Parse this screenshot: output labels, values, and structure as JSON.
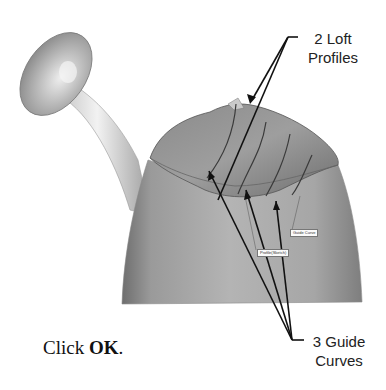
{
  "figure": {
    "callouts": {
      "loft_profiles": {
        "line1": "2 Loft",
        "line2": "Profiles"
      },
      "guide_curves": {
        "line1": "3 Guide",
        "line2": "Curves"
      }
    },
    "in_model_labels": {
      "guide_curve": "Guide Curve",
      "profile": "Profile(Sketch)"
    },
    "colors": {
      "surface": "#a8a8a8",
      "surface_dark": "#7d7d7d",
      "leader_line": "#111111"
    }
  },
  "instruction": {
    "prefix": "Click ",
    "button_name": "OK",
    "suffix": "."
  }
}
